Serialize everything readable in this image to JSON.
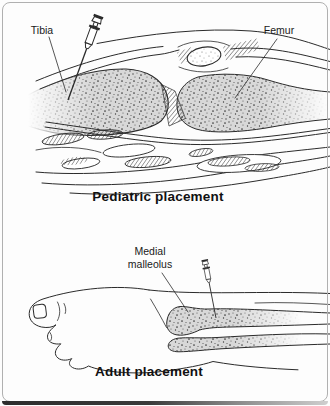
{
  "panels": {
    "pediatric": {
      "caption": "Pediatric placement",
      "labels": {
        "tibia": "Tibia",
        "femur": "Femur"
      },
      "icons": [
        {
          "name": "syringe-icon"
        }
      ]
    },
    "adult": {
      "caption": "Adult placement",
      "labels": {
        "medial_malleolus": "Medial malleolus"
      },
      "icons": [
        {
          "name": "syringe-icon"
        }
      ]
    }
  },
  "colors": {
    "line": "#2b2b2b",
    "bone_fill": "#d8d8d8",
    "frame_border": "#b0b0b0",
    "bottom_shadow": "#2d2d2d",
    "background": "#fdfdfd"
  }
}
